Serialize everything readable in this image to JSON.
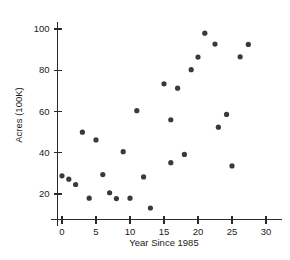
{
  "chart_data": {
    "type": "scatter",
    "title": "",
    "xlabel": "Year Since 1985",
    "ylabel": "Acres (100K)",
    "xlim": [
      -1.5,
      31.5
    ],
    "ylim": [
      10,
      105
    ],
    "xticks": [
      0,
      5,
      10,
      15,
      20,
      25,
      30
    ],
    "yticks": [
      20,
      40,
      60,
      80,
      100
    ],
    "xticklabels": [
      "0",
      "5",
      "10",
      "15",
      "20",
      "25",
      "30"
    ],
    "yticklabels": [
      "20",
      "40",
      "60",
      "80",
      "100"
    ],
    "grid": false,
    "legend": null,
    "marker": "filled-circle",
    "marker_color": "#3a3a3a",
    "points": [
      {
        "x": 0,
        "y": 28.8
      },
      {
        "x": 1,
        "y": 27.2
      },
      {
        "x": 2,
        "y": 24.6
      },
      {
        "x": 4,
        "y": 18.0
      },
      {
        "x": 3,
        "y": 50.0
      },
      {
        "x": 5,
        "y": 46.2
      },
      {
        "x": 6,
        "y": 29.4
      },
      {
        "x": 7,
        "y": 20.6
      },
      {
        "x": 8,
        "y": 17.8
      },
      {
        "x": 9,
        "y": 40.5
      },
      {
        "x": 10,
        "y": 18.0
      },
      {
        "x": 11,
        "y": 60.4
      },
      {
        "x": 12,
        "y": 28.3
      },
      {
        "x": 13,
        "y": 13.2
      },
      {
        "x": 15,
        "y": 73.4
      },
      {
        "x": 16,
        "y": 56.0
      },
      {
        "x": 16,
        "y": 35.2
      },
      {
        "x": 17,
        "y": 71.3
      },
      {
        "x": 18,
        "y": 39.2
      },
      {
        "x": 19,
        "y": 80.3
      },
      {
        "x": 20,
        "y": 86.4
      },
      {
        "x": 21,
        "y": 98.0
      },
      {
        "x": 22.5,
        "y": 92.7
      },
      {
        "x": 23,
        "y": 52.4
      },
      {
        "x": 24.2,
        "y": 58.6
      },
      {
        "x": 25,
        "y": 33.6
      },
      {
        "x": 26.2,
        "y": 86.5
      },
      {
        "x": 27.4,
        "y": 92.5
      }
    ]
  }
}
